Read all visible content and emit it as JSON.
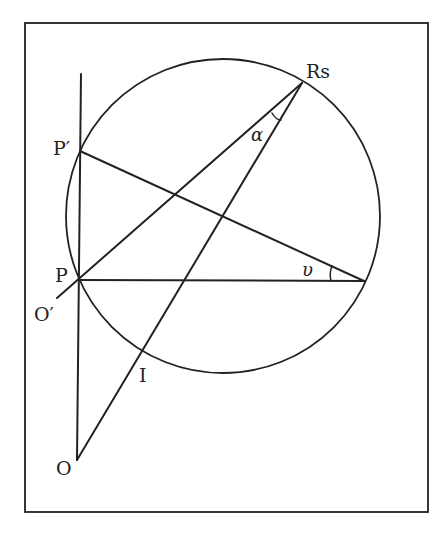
{
  "diagram": {
    "type": "geometric construction",
    "frame": {
      "x1": 25,
      "y1": 23,
      "x2": 428,
      "y2": 512,
      "stroke": "#222222"
    },
    "circle": {
      "cx": 223,
      "cy": 216,
      "r": 157
    },
    "points": {
      "Rs": {
        "x": 302,
        "y": 83,
        "label": "Rs"
      },
      "P_prime": {
        "x": 80,
        "y": 151,
        "label": "P′"
      },
      "P": {
        "x": 78,
        "y": 280,
        "label": "P"
      },
      "V": {
        "x": 364,
        "y": 281,
        "label": ""
      },
      "I": {
        "x": 143,
        "y": 348,
        "label": "I"
      },
      "O": {
        "x": 77,
        "y": 460,
        "label": "O"
      },
      "O_prime": {
        "x": 57,
        "y": 298,
        "label": "O′"
      }
    },
    "angles": {
      "alpha": {
        "label": "α",
        "vertex": "Rs"
      },
      "nu": {
        "label": "υ",
        "vertex": "V"
      }
    },
    "lines": [
      {
        "name": "vertical-axis",
        "from": "top",
        "to": "O"
      },
      {
        "name": "line-P-prime-V",
        "from": "P_prime",
        "to": "V"
      },
      {
        "name": "line-P-V",
        "from": "P",
        "to": "V"
      },
      {
        "name": "line-O-prime-Rs",
        "from": "O_prime",
        "to": "Rs"
      },
      {
        "name": "line-O-Rs",
        "from": "O",
        "to": "Rs"
      }
    ]
  }
}
